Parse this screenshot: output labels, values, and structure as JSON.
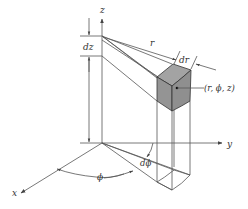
{
  "diagram": {
    "axes": {
      "x_label": "x",
      "y_label": "y",
      "z_label": "z"
    },
    "labels": {
      "dz": "dz",
      "r": "r",
      "dr": "dr",
      "point": "(r, ϕ, z)",
      "phi": "ϕ",
      "dphi": "dϕ"
    },
    "colors": {
      "line": "#555555",
      "cube_front": "#9a9a9a",
      "cube_side": "#8a8a8a",
      "cube_top": "#a8a8a8",
      "text": "#333333"
    }
  }
}
